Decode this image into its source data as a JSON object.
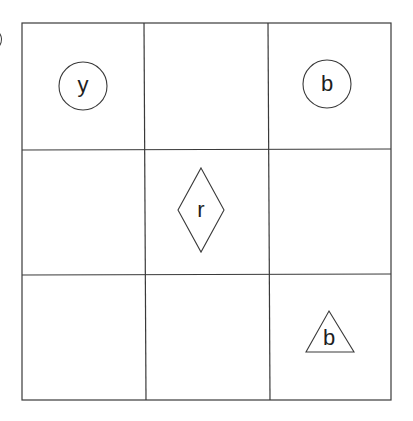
{
  "diagram": {
    "type": "3x3-grid-puzzle",
    "grid": {
      "rows": 3,
      "cols": 3,
      "line_color": "#3a3a3a"
    },
    "cells": [
      {
        "row": 0,
        "col": 0,
        "shape": "circle",
        "label": "y"
      },
      {
        "row": 0,
        "col": 1,
        "shape": "empty",
        "label": ""
      },
      {
        "row": 0,
        "col": 2,
        "shape": "circle",
        "label": "b"
      },
      {
        "row": 1,
        "col": 0,
        "shape": "empty",
        "label": ""
      },
      {
        "row": 1,
        "col": 1,
        "shape": "diamond",
        "label": "r"
      },
      {
        "row": 1,
        "col": 2,
        "shape": "empty",
        "label": ""
      },
      {
        "row": 2,
        "col": 0,
        "shape": "empty",
        "label": ""
      },
      {
        "row": 2,
        "col": 1,
        "shape": "empty",
        "label": ""
      },
      {
        "row": 2,
        "col": 2,
        "shape": "triangle",
        "label": "b"
      }
    ],
    "labels": {
      "circle_r0c0": "y",
      "circle_r0c2": "b",
      "diamond_r1c1": "r",
      "triangle_r2c2": "b"
    }
  }
}
